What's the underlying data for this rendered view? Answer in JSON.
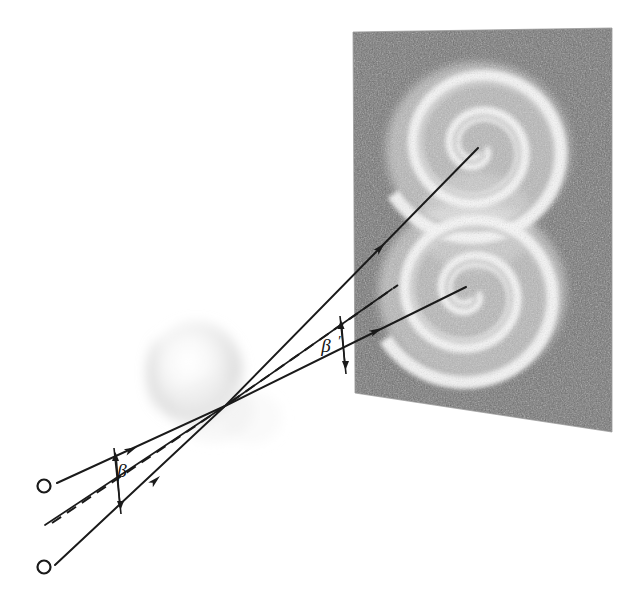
{
  "figure": {
    "background_color": "#ffffff",
    "ink_color": "#1a1a1a",
    "width": 637,
    "height": 596
  },
  "labels": {
    "source_upper": "O",
    "source_lower": "O",
    "angle_near_source": "β",
    "angle_near_plate": "β",
    "angle_near_plate_prime": "′"
  },
  "sources": [
    {
      "name": "upper-source",
      "label": "O",
      "x": 44,
      "y": 486,
      "radius": 6.5
    },
    {
      "name": "lower-source",
      "label": "O",
      "x": 44,
      "y": 567,
      "radius": 6.5
    }
  ],
  "lens": {
    "name": "deflecting-mass",
    "center_x": 196,
    "center_y": 374,
    "radius_x": 47,
    "radius_y": 52,
    "tint": "#e9e9e9",
    "convergence_x": 225,
    "convergence_y": 406
  },
  "rays": [
    {
      "name": "ray-upper",
      "style": "solid",
      "from_x": 57,
      "from_y": 483,
      "to_x": 478,
      "to_y": 148,
      "arrowheads": [
        {
          "x": 133,
          "y": 462,
          "angle": -14
        },
        {
          "x": 384,
          "y": 225,
          "angle": -38
        }
      ]
    },
    {
      "name": "ray-middle-dashed",
      "style": "dashed",
      "from_x": 45,
      "from_y": 525,
      "to_x": 392,
      "to_y": 289,
      "arrowheads": []
    },
    {
      "name": "ray-lower",
      "style": "solid",
      "from_x": 55,
      "from_y": 565,
      "to_x": 466,
      "to_y": 287,
      "arrowheads": [
        {
          "x": 155,
          "y": 483,
          "angle": -30
        },
        {
          "x": 382,
          "y": 311,
          "angle": -30
        }
      ]
    },
    {
      "name": "ray-middle-solid",
      "style": "solid",
      "from_x": 45,
      "from_y": 525,
      "to_x": 392,
      "to_y": 289,
      "arrowheads": []
    }
  ],
  "angle_markers": [
    {
      "name": "beta-near-source",
      "label": "β",
      "label_x": 123,
      "label_y": 478,
      "bar_x1": 115,
      "bar_y1": 449,
      "bar_x2": 122,
      "bar_y2": 513,
      "top_x": 116,
      "top_y": 451,
      "bottom_x": 122,
      "bottom_y": 512
    },
    {
      "name": "beta-prime-near-plate",
      "label": "β",
      "prime": "′",
      "label_x": 327,
      "label_y": 350,
      "bar_x1": 341,
      "bar_y1": 318,
      "bar_x2": 346,
      "bar_y2": 372,
      "top_x": 341,
      "top_y": 320,
      "bottom_x": 346,
      "bottom_y": 371
    }
  ],
  "plate": {
    "name": "photographic-plate",
    "description": "grainy photographic plate showing two bright spirals",
    "corners": {
      "top_left_x": 353,
      "top_left_y": 32,
      "top_right_x": 612,
      "top_right_y": 28,
      "bottom_right_x": 612,
      "bottom_right_y": 432,
      "bottom_left_x": 355,
      "bottom_left_y": 393
    },
    "background_dark": "#6e6e6e",
    "background_light": "#f2f2f2"
  },
  "spirals": [
    {
      "name": "upper-spiral",
      "center_x": 478,
      "center_y": 148,
      "turns": 2.35,
      "max_radius": 96,
      "stroke": "#fbfbfb"
    },
    {
      "name": "lower-spiral",
      "center_x": 470,
      "center_y": 293,
      "turns": 2.35,
      "max_radius": 96,
      "stroke": "#fbfbfb"
    }
  ]
}
